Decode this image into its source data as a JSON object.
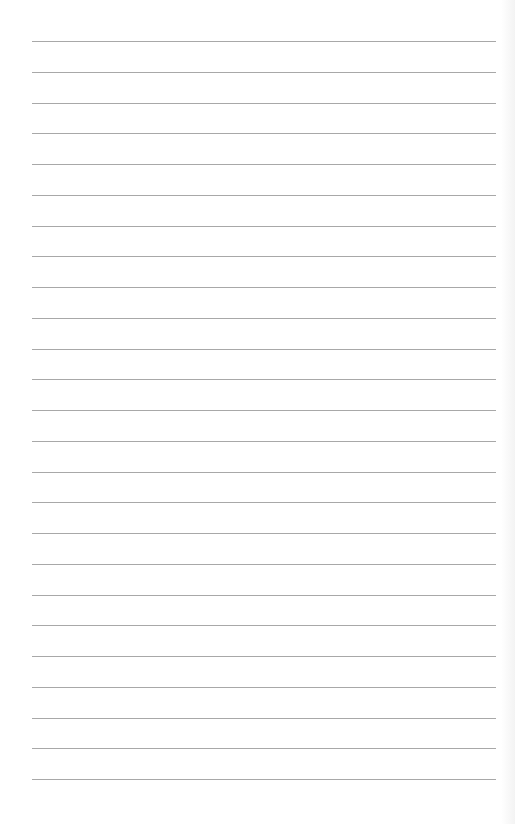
{
  "page": {
    "type": "lined-paper",
    "line_count": 25,
    "first_line_y": 41,
    "line_spacing": 30.75,
    "line_left": 32,
    "line_width": 464,
    "line_color": "#a8a8a8",
    "background_color": "#ffffff"
  }
}
